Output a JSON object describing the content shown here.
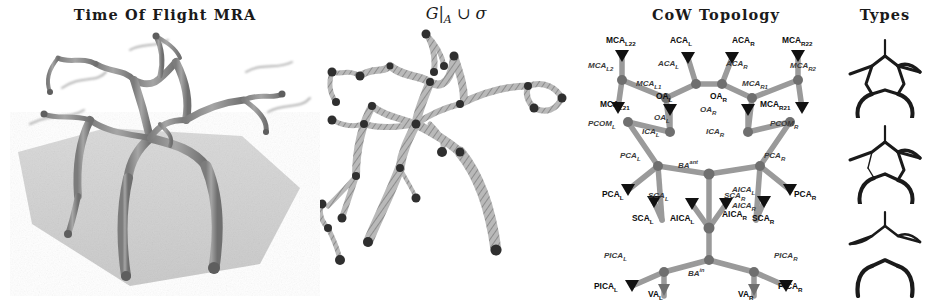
{
  "figure": {
    "panels": [
      {
        "id": "tof",
        "title": "Time Of Flight MRA",
        "kind": "volume-rendering"
      },
      {
        "id": "graph",
        "title": "G|ₐ ∪ σ",
        "title_parts": {
          "g": "G",
          "bar": "|",
          "sub": "A",
          "union": "∪",
          "sigma": "σ"
        },
        "kind": "centerline-graph"
      },
      {
        "id": "topology",
        "title": "CoW Topology",
        "kind": "node-link-diagram"
      },
      {
        "id": "types",
        "title": "Types",
        "kind": "variant-icons"
      }
    ]
  },
  "topology": {
    "nodes": [
      {
        "name": "MCA",
        "sub": "L22",
        "x": 14,
        "y": 14
      },
      {
        "name": "ACA",
        "sub": "L",
        "x": 76,
        "y": 14
      },
      {
        "name": "ACA",
        "sub": "R",
        "x": 139,
        "y": 14
      },
      {
        "name": "MCA",
        "sub": "R22",
        "x": 196,
        "y": 14
      },
      {
        "name": "MCA",
        "sub": "L21",
        "x": 10,
        "y": 70
      },
      {
        "name": "OA",
        "sub": "L",
        "x": 77,
        "y": 70
      },
      {
        "name": "OA",
        "sub": "R",
        "x": 112,
        "y": 70
      },
      {
        "name": "MCA",
        "sub": "R21",
        "x": 172,
        "y": 70
      },
      {
        "name": "PCA",
        "sub": "L",
        "x": 12,
        "y": 152
      },
      {
        "name": "PCA",
        "sub": "R",
        "x": 176,
        "y": 152
      },
      {
        "name": "SCA",
        "sub": "L",
        "x": 44,
        "y": 182
      },
      {
        "name": "AICA",
        "sub": "L",
        "x": 84,
        "y": 182
      },
      {
        "name": "AICA",
        "sub": "R",
        "x": 128,
        "y": 176
      },
      {
        "name": "SCA",
        "sub": "R",
        "x": 152,
        "y": 182
      },
      {
        "name": "PICA",
        "sub": "L",
        "x": 8,
        "y": 250
      },
      {
        "name": "VA",
        "sub": "L",
        "x": 60,
        "y": 258
      },
      {
        "name": "VA",
        "sub": "R",
        "x": 132,
        "y": 258
      },
      {
        "name": "PICA",
        "sub": "R",
        "x": 180,
        "y": 250
      }
    ],
    "edges": [
      {
        "name": "MCA",
        "sub": "L2",
        "x": 2,
        "y": 36
      },
      {
        "name": "MCA",
        "sub": "L1",
        "x": 44,
        "y": 50
      },
      {
        "name": "ACA",
        "sub": "L",
        "x": 64,
        "y": 34
      },
      {
        "name": "ACA",
        "sub": "R",
        "x": 130,
        "y": 34
      },
      {
        "name": "MCA",
        "sub": "R1",
        "x": 152,
        "y": 50
      },
      {
        "name": "MCA",
        "sub": "R2",
        "x": 196,
        "y": 36
      },
      {
        "name": "OA",
        "sub": "L",
        "x": 70,
        "y": 84
      },
      {
        "name": "OA",
        "sub": "R",
        "x": 106,
        "y": 82
      },
      {
        "name": "ICA",
        "sub": "L",
        "x": 52,
        "y": 98
      },
      {
        "name": "ICA",
        "sub": "R",
        "x": 114,
        "y": 98
      },
      {
        "name": "PCOM",
        "sub": "L",
        "x": 2,
        "y": 96
      },
      {
        "name": "PCOM",
        "sub": "R",
        "x": 168,
        "y": 96
      },
      {
        "name": "PCA",
        "sub": "L",
        "x": 30,
        "y": 122
      },
      {
        "name": "PCA",
        "sub": "R",
        "x": 152,
        "y": 122
      },
      {
        "name": "BA",
        "sup": "ant",
        "x": 92,
        "y": 124
      },
      {
        "name": "SCA",
        "sub": "L",
        "x": 56,
        "y": 164
      },
      {
        "name": "SCA",
        "sub": "R",
        "x": 134,
        "y": 164
      },
      {
        "name": "AICA",
        "sub": "L",
        "x": 116,
        "y": 160
      },
      {
        "name": "AICA",
        "sub": "R",
        "x": 116,
        "y": 172
      },
      {
        "name": "PICA",
        "sub": "L",
        "x": 14,
        "y": 222
      },
      {
        "name": "PICA",
        "sub": "R",
        "x": 168,
        "y": 222
      },
      {
        "name": "BA",
        "sup": "in",
        "x": 88,
        "y": 238
      }
    ]
  },
  "types": [
    {
      "index": 1,
      "label": "complete-circle"
    },
    {
      "index": 2,
      "label": "partial-posterior-communicating"
    },
    {
      "index": 3,
      "label": "separated-anterior-posterior"
    }
  ],
  "colors": {
    "ink": "#111111",
    "vessel_gray": "#8d8d8d",
    "node_dark": "#3b3b3b",
    "edge_label": "#3a3a3a",
    "slab": "#c9c9c9",
    "background": "#ffffff"
  }
}
